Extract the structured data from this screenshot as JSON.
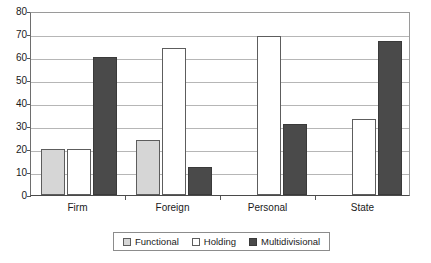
{
  "chart_data": {
    "type": "bar",
    "title": "",
    "xlabel": "",
    "ylabel": "",
    "categories": [
      "Firm",
      "Foreign",
      "Personal",
      "State"
    ],
    "series": [
      {
        "name": "Functional",
        "color": "#d6d6d6",
        "values": [
          20,
          24,
          0,
          0
        ]
      },
      {
        "name": "Holding",
        "color": "#ffffff",
        "values": [
          20,
          64,
          69,
          33
        ]
      },
      {
        "name": "Multidivisional",
        "color": "#4a4a4a",
        "values": [
          60,
          12,
          31,
          67
        ]
      }
    ],
    "ylim": [
      0,
      80
    ],
    "ytick_labels": [
      "0",
      "10",
      "20",
      "30",
      "40",
      "50",
      "60",
      "70",
      "80"
    ],
    "ytick_values": [
      0,
      10,
      20,
      30,
      40,
      50,
      60,
      70,
      80
    ],
    "grid": true,
    "legend_position": "bottom"
  },
  "legend": {
    "entries": [
      {
        "label": "Functional"
      },
      {
        "label": "Holding"
      },
      {
        "label": "Multidivisional"
      }
    ]
  }
}
